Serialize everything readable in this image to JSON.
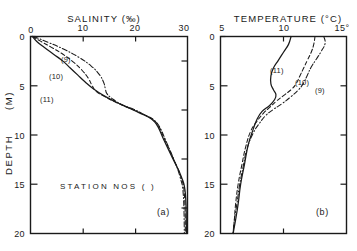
{
  "figure": {
    "caption_markers": [
      "(a)",
      "(b)"
    ],
    "annotation": "STATION  NOS (  )"
  },
  "chart_data": [
    {
      "type": "line",
      "panel": "(a)",
      "title": "SALINITY (‰)",
      "xlabel": "SALINITY (‰)",
      "ylabel": "DEPTH (M)",
      "xlim": [
        0,
        30
      ],
      "ylim": [
        0,
        20
      ],
      "y_inverted": true,
      "xticks": [
        0,
        10,
        20,
        30
      ],
      "xtick_labels": [
        "0",
        "10",
        "20",
        "30"
      ],
      "yticks": [
        0,
        5,
        10,
        15,
        20
      ],
      "ytick_labels": [
        "0",
        "5",
        "10",
        "15",
        "20"
      ],
      "grid": false,
      "legend_position": "inline-labels",
      "series": [
        {
          "name": "(11)",
          "style": "solid",
          "x": [
            0.4,
            1.2,
            2.6,
            4.4,
            6.2,
            7.6,
            9.0,
            10.4,
            12.0,
            14.0,
            16.5,
            19.0,
            21.0,
            22.6,
            23.6,
            24.4,
            25.4,
            27.2,
            28.8,
            29.6,
            29.8
          ],
          "y": [
            0.0,
            0.5,
            1.1,
            1.8,
            2.5,
            3.2,
            3.9,
            4.6,
            5.3,
            6.0,
            6.7,
            7.3,
            7.8,
            8.2,
            8.6,
            9.2,
            10.4,
            12.4,
            14.2,
            16.0,
            20.0
          ]
        },
        {
          "name": "(10)",
          "style": "dashed",
          "x": [
            0.4,
            2.0,
            4.0,
            6.2,
            8.2,
            9.8,
            11.0,
            11.8,
            12.6,
            14.2,
            16.4,
            19.0,
            21.2,
            22.8,
            23.8,
            24.6,
            25.6,
            27.3,
            28.7,
            29.4,
            29.6
          ],
          "y": [
            0.0,
            0.5,
            1.1,
            1.8,
            2.6,
            3.4,
            4.2,
            5.0,
            5.6,
            6.1,
            6.7,
            7.3,
            7.8,
            8.2,
            8.6,
            9.2,
            10.4,
            12.4,
            14.2,
            16.0,
            20.0
          ]
        },
        {
          "name": "(9)",
          "style": "dashdot",
          "x": [
            0.6,
            3.4,
            6.4,
            9.2,
            11.6,
            13.2,
            14.0,
            14.3,
            14.6,
            15.6,
            17.4,
            19.8,
            21.6,
            23.0,
            24.0,
            24.8,
            25.8,
            27.4,
            28.6,
            29.2,
            29.4
          ],
          "y": [
            0.0,
            0.6,
            1.3,
            2.1,
            3.0,
            3.9,
            4.7,
            5.3,
            5.8,
            6.3,
            6.9,
            7.4,
            7.9,
            8.3,
            8.7,
            9.3,
            10.5,
            12.5,
            14.3,
            16.1,
            20.0
          ]
        }
      ]
    },
    {
      "type": "line",
      "panel": "(b)",
      "title": "TEMPERATURE (°C)",
      "xlabel": "TEMPERATURE (°C)",
      "ylabel": "DEPTH (M)",
      "xlim": [
        5,
        15
      ],
      "ylim": [
        0,
        20
      ],
      "y_inverted": true,
      "xticks": [
        5,
        10,
        15
      ],
      "xtick_labels": [
        "5",
        "10",
        "15°"
      ],
      "yticks": [
        0,
        5,
        10,
        15,
        20
      ],
      "ytick_labels": [
        "0",
        "5",
        "10",
        "15",
        "20"
      ],
      "grid": false,
      "legend_position": "inline-labels",
      "series": [
        {
          "name": "(11)",
          "style": "solid",
          "x": [
            10.6,
            10.4,
            10.0,
            9.6,
            9.2,
            9.0,
            9.0,
            9.2,
            9.4,
            9.3,
            8.9,
            8.3,
            7.9,
            7.6,
            7.2,
            6.9,
            6.6,
            6.4,
            6.2,
            6.0
          ],
          "y": [
            0.0,
            0.8,
            1.6,
            2.4,
            3.2,
            4.0,
            4.8,
            5.4,
            5.9,
            6.4,
            7.0,
            7.6,
            8.4,
            9.4,
            11.0,
            13.0,
            15.0,
            17.0,
            18.6,
            20.0
          ]
        },
        {
          "name": "(10)",
          "style": "dashed",
          "x": [
            12.5,
            12.4,
            12.2,
            11.9,
            11.6,
            11.3,
            11.0,
            10.6,
            10.0,
            9.4,
            8.9,
            8.4,
            7.9,
            7.4,
            7.0,
            6.7,
            6.4,
            6.2,
            6.1,
            6.0
          ],
          "y": [
            0.0,
            0.8,
            1.6,
            2.4,
            3.2,
            4.0,
            4.8,
            5.4,
            6.0,
            6.6,
            7.2,
            7.8,
            8.6,
            9.6,
            11.2,
            13.0,
            15.0,
            17.0,
            18.6,
            20.0
          ]
        },
        {
          "name": "(9)",
          "style": "dashdot",
          "x": [
            13.2,
            13.3,
            13.0,
            12.6,
            12.2,
            11.9,
            11.6,
            11.2,
            10.6,
            9.9,
            9.2,
            8.6,
            8.1,
            7.6,
            7.1,
            6.8,
            6.5,
            6.3,
            6.1,
            6.0
          ],
          "y": [
            0.0,
            0.7,
            1.5,
            2.3,
            3.1,
            3.9,
            4.7,
            5.4,
            6.1,
            6.8,
            7.4,
            8.0,
            8.8,
            9.8,
            11.4,
            13.2,
            15.2,
            17.0,
            18.6,
            20.0
          ]
        }
      ]
    }
  ],
  "panel_a": {
    "title": "SALINITY (‰)",
    "xticks": [
      "0",
      "10",
      "20",
      "30"
    ],
    "yticks": [
      "0",
      "5",
      "10",
      "15",
      "20"
    ],
    "curve_labels": [
      "(9)",
      "(10)",
      "(11)"
    ],
    "note": "STATION  NOS (  )",
    "marker": "(a)"
  },
  "panel_b": {
    "title": "TEMPERATURE (°C)",
    "xticks": [
      "5",
      "10",
      "15°"
    ],
    "yticks": [
      "0",
      "5",
      "10",
      "15",
      "20"
    ],
    "curve_labels": [
      "(11)",
      "(10)",
      "(9)"
    ],
    "marker": "(b)"
  },
  "axis": {
    "depth_word": "DEPTH",
    "depth_unit": "(M)"
  },
  "colors": {
    "ink": "#1a1a1a",
    "background": "#ffffff"
  }
}
